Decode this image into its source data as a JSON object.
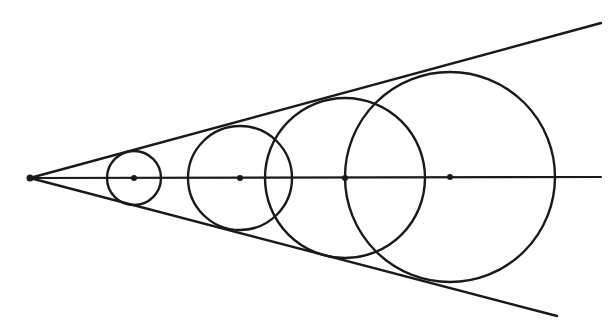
{
  "diagram": {
    "stroke_color": "#1a1a1a",
    "background": "#ffffff",
    "vertex": {
      "x": 30,
      "y": 178,
      "r": 3.5
    },
    "axis": {
      "x1": 30,
      "y1": 178,
      "x2": 601,
      "y2": 177
    },
    "upper_side": {
      "x1": 30,
      "y1": 178,
      "x2": 601,
      "y2": 23
    },
    "lower_side": {
      "x1": 30,
      "y1": 178,
      "x2": 557,
      "y2": 316
    },
    "circles": [
      {
        "cx": 134,
        "cy": 178,
        "r": 27
      },
      {
        "cx": 240,
        "cy": 178,
        "r": 52
      },
      {
        "cx": 345,
        "cy": 178,
        "r": 80
      },
      {
        "cx": 450,
        "cy": 177,
        "r": 105
      }
    ],
    "center_dot_radius": 3
  }
}
